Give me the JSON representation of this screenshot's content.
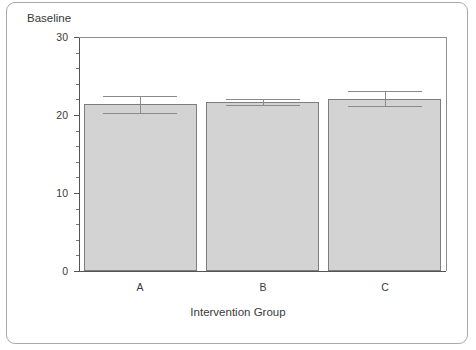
{
  "chart_data": {
    "type": "bar",
    "title": "",
    "ylabel": "Baseline",
    "xlabel": "Intervention Group",
    "categories": [
      "A",
      "B",
      "C"
    ],
    "values": [
      21.4,
      21.7,
      22.1
    ],
    "errors": [
      1.1,
      0.4,
      1.0
    ],
    "error_type": "symmetric",
    "ylim": [
      0,
      30
    ],
    "ytick_labels": [
      "0",
      "10",
      "20",
      "30"
    ],
    "ytick_values": [
      0,
      10,
      20,
      30
    ],
    "yminor_step": 2,
    "grid": false,
    "legend": null,
    "bar_color": "#d3d3d3",
    "bar_edge_color": "#7d7d7d",
    "errorbar_color": "#8a8a8a",
    "axis_color": "#545454",
    "text_color": "#3a3a3a",
    "frame_color": "#a9a9a9"
  }
}
